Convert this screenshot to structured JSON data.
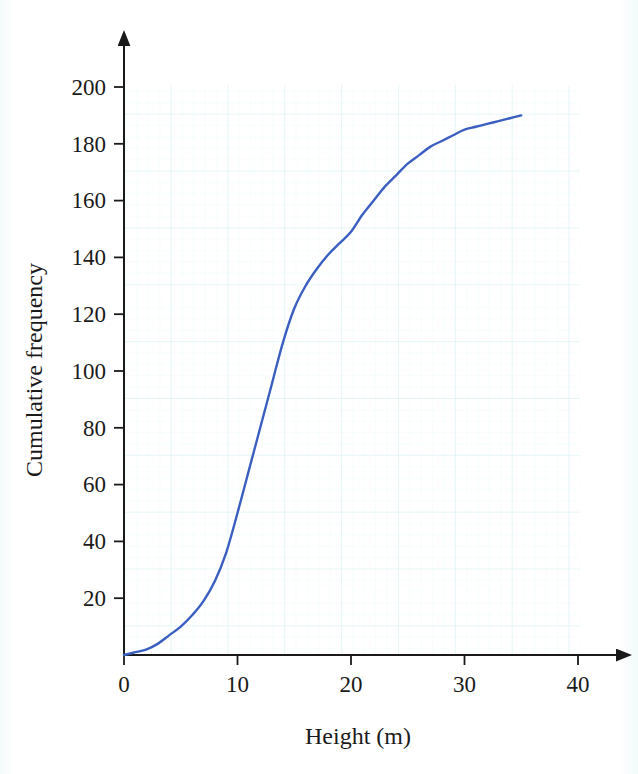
{
  "chart_data": {
    "type": "line",
    "title": "",
    "subtitle": "",
    "xlabel": "Height (m)",
    "ylabel": "Cumulative frequency",
    "xlim": [
      0,
      42
    ],
    "ylim": [
      0,
      205
    ],
    "xticks": [
      0,
      10,
      20,
      30,
      40
    ],
    "yticks": [
      20,
      40,
      60,
      80,
      100,
      120,
      140,
      160,
      180,
      200
    ],
    "xtick_labels": [
      "0",
      "10",
      "20",
      "30",
      "40"
    ],
    "ytick_labels": [
      "20",
      "40",
      "60",
      "80",
      "100",
      "120",
      "140",
      "160",
      "180",
      "200"
    ],
    "grid": true,
    "grid_color": "#d9f0f2",
    "grid_minor_spacing_x": 1,
    "grid_major_spacing_x": 5,
    "grid_major_spacing_y": 20,
    "legend": "none",
    "axis_arrows": true,
    "series": [
      {
        "name": "Cumulative frequency",
        "color": "#3b5fc0",
        "linewidth": 2.4,
        "x": [
          0,
          1,
          2,
          3,
          4,
          5,
          6,
          7,
          8,
          9,
          10,
          11,
          12,
          13,
          14,
          15,
          16,
          17,
          18,
          19,
          20,
          21,
          22,
          23,
          24,
          25,
          26,
          27,
          28,
          29,
          30,
          31,
          32,
          33,
          34,
          35
        ],
        "y": [
          0,
          1,
          2,
          4,
          7,
          10,
          14,
          19,
          26,
          36,
          50,
          65,
          80,
          95,
          110,
          122,
          130,
          136,
          141,
          145,
          149,
          155,
          160,
          165,
          169,
          173,
          176,
          179,
          181,
          183,
          185,
          186,
          187,
          188,
          189,
          190
        ]
      }
    ],
    "annotations": []
  },
  "axes": {
    "x_axis_name": "x-axis",
    "y_axis_name": "y-axis"
  }
}
